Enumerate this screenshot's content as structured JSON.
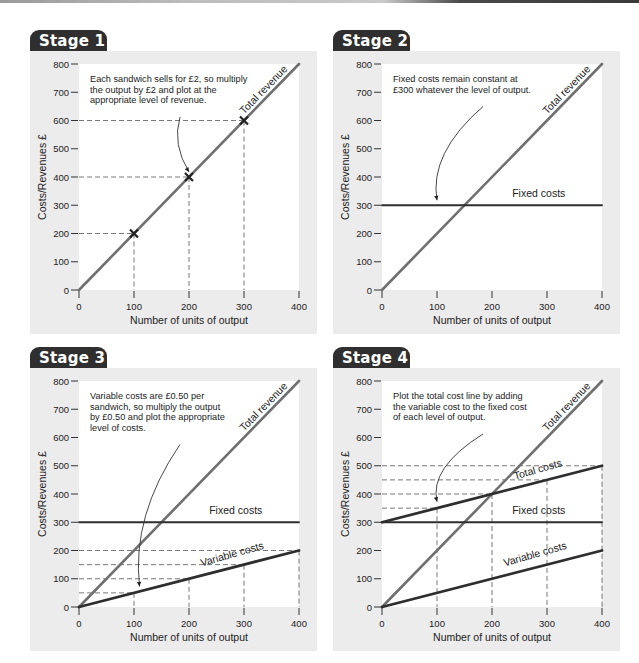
{
  "page": {
    "colors": {
      "tab_bg": "#2f2f2f",
      "panel_bg": "#ececec",
      "plot_bg": "#ffffff",
      "revenue_line": "#707070",
      "cost_line": "#2e2e2e",
      "guide_dash": "#555555"
    }
  },
  "chart_data": [
    {
      "type": "line",
      "title": "Stage 1",
      "xlabel": "Number of units of output",
      "ylabel": "Costs/Revenues £",
      "xlim": [
        0,
        400
      ],
      "ylim": [
        0,
        800
      ],
      "x_ticks": [
        0,
        100,
        200,
        300,
        400
      ],
      "y_ticks": [
        0,
        100,
        200,
        300,
        400,
        500,
        600,
        700,
        800
      ],
      "grid": false,
      "series": [
        {
          "name": "Total revenue",
          "x": [
            0,
            400
          ],
          "y": [
            0,
            800
          ],
          "style": "revenue"
        }
      ],
      "markers": [
        {
          "x": 100,
          "y": 200,
          "symbol": "x"
        },
        {
          "x": 200,
          "y": 400,
          "symbol": "x"
        },
        {
          "x": 300,
          "y": 600,
          "symbol": "x"
        }
      ],
      "guides": [
        {
          "x": 100,
          "y": 200
        },
        {
          "x": 200,
          "y": 400
        },
        {
          "x": 300,
          "y": 600
        }
      ],
      "line_labels": [
        {
          "text": "Total revenue",
          "x": 340,
          "y": 700,
          "angle": -45.8
        }
      ],
      "annotation": {
        "lines": [
          "Each sandwich sells for £2, so multiply",
          "the output by £2 and plot at the",
          "appropriate level of revenue."
        ],
        "arrow_to": {
          "x": 200,
          "y": 400
        }
      }
    },
    {
      "type": "line",
      "title": "Stage 2",
      "xlabel": "Number of units of output",
      "ylabel": "Costs/Revenues £",
      "xlim": [
        0,
        400
      ],
      "ylim": [
        0,
        800
      ],
      "x_ticks": [
        0,
        100,
        200,
        300,
        400
      ],
      "y_ticks": [
        0,
        100,
        200,
        300,
        400,
        500,
        600,
        700,
        800
      ],
      "grid": false,
      "series": [
        {
          "name": "Total revenue",
          "x": [
            0,
            400
          ],
          "y": [
            0,
            800
          ],
          "style": "revenue"
        },
        {
          "name": "Fixed costs",
          "x": [
            0,
            400
          ],
          "y": [
            300,
            300
          ],
          "style": "cost"
        }
      ],
      "markers": [],
      "guides": [],
      "line_labels": [
        {
          "text": "Total revenue",
          "x": 340,
          "y": 700,
          "angle": -45.8
        },
        {
          "text": "Fixed costs",
          "x": 285,
          "y": 330,
          "angle": 0
        }
      ],
      "annotation": {
        "lines": [
          "Fixed costs remain constant at",
          "£300 whatever the level of output."
        ],
        "arrow_to": {
          "x": 100,
          "y": 300
        }
      }
    },
    {
      "type": "line",
      "title": "Stage 3",
      "xlabel": "Number of units of output",
      "ylabel": "Costs/Revenues £",
      "xlim": [
        0,
        400
      ],
      "ylim": [
        0,
        800
      ],
      "x_ticks": [
        0,
        100,
        200,
        300,
        400
      ],
      "y_ticks": [
        0,
        100,
        200,
        300,
        400,
        500,
        600,
        700,
        800
      ],
      "grid": false,
      "series": [
        {
          "name": "Total revenue",
          "x": [
            0,
            400
          ],
          "y": [
            0,
            800
          ],
          "style": "revenue"
        },
        {
          "name": "Fixed costs",
          "x": [
            0,
            400
          ],
          "y": [
            300,
            300
          ],
          "style": "cost"
        },
        {
          "name": "Variable costs",
          "x": [
            0,
            400
          ],
          "y": [
            0,
            200
          ],
          "style": "cost"
        }
      ],
      "markers": [],
      "guides": [
        {
          "x": 100,
          "y": 50
        },
        {
          "x": 200,
          "y": 100
        },
        {
          "x": 300,
          "y": 150
        },
        {
          "x": 400,
          "y": 200
        }
      ],
      "line_labels": [
        {
          "text": "Total revenue",
          "x": 340,
          "y": 700,
          "angle": -45.8
        },
        {
          "text": "Fixed costs",
          "x": 285,
          "y": 330,
          "angle": 0
        },
        {
          "text": "Variable costs",
          "x": 280,
          "y": 175,
          "angle": -16
        }
      ],
      "annotation": {
        "lines": [
          "Variable costs are £0.50 per",
          "sandwich, so multiply the output",
          "by £0.50 and plot the appropriate",
          "level of costs."
        ],
        "arrow_to": {
          "x": 110,
          "y": 55
        }
      }
    },
    {
      "type": "line",
      "title": "Stage 4",
      "xlabel": "Number of units of output",
      "ylabel": "Costs/Revenues £",
      "xlim": [
        0,
        400
      ],
      "ylim": [
        0,
        800
      ],
      "x_ticks": [
        0,
        100,
        200,
        300,
        400
      ],
      "y_ticks": [
        0,
        100,
        200,
        300,
        400,
        500,
        600,
        700,
        800
      ],
      "grid": false,
      "series": [
        {
          "name": "Total revenue",
          "x": [
            0,
            400
          ],
          "y": [
            0,
            800
          ],
          "style": "revenue"
        },
        {
          "name": "Total costs",
          "x": [
            0,
            400
          ],
          "y": [
            300,
            500
          ],
          "style": "cost"
        },
        {
          "name": "Fixed costs",
          "x": [
            0,
            400
          ],
          "y": [
            300,
            300
          ],
          "style": "cost"
        },
        {
          "name": "Variable costs",
          "x": [
            0,
            400
          ],
          "y": [
            0,
            200
          ],
          "style": "cost"
        }
      ],
      "markers": [],
      "guides": [
        {
          "x": 100,
          "y": 350
        },
        {
          "x": 200,
          "y": 400
        },
        {
          "x": 300,
          "y": 450
        },
        {
          "x": 400,
          "y": 500
        }
      ],
      "line_labels": [
        {
          "text": "Total revenue",
          "x": 340,
          "y": 700,
          "angle": -45.8
        },
        {
          "text": "Total costs",
          "x": 285,
          "y": 475,
          "angle": -16
        },
        {
          "text": "Fixed costs",
          "x": 285,
          "y": 330,
          "angle": 0
        },
        {
          "text": "Variable costs",
          "x": 280,
          "y": 175,
          "angle": -16
        }
      ],
      "annotation": {
        "lines": [
          "Plot the total cost line by adding",
          "the variable cost to the fixed cost",
          "of each level of output."
        ],
        "arrow_to": {
          "x": 100,
          "y": 355
        }
      }
    }
  ]
}
